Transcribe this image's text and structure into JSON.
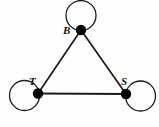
{
  "figure": {
    "type": "graph-diagram",
    "title": "",
    "background_color": "#fefefe",
    "stroke_color": "#1a1a1a",
    "node_fill_color": "#000000",
    "width": 159,
    "height": 127
  },
  "graph_data": {
    "type": "graph",
    "description": "Undirected graph on three vertices B, T, S forming a triangle, with a self-loop at each vertex",
    "vertices": [
      {
        "id": "B",
        "label": "B",
        "cx": 81,
        "cy": 30,
        "r": 5.2,
        "label_x": 63,
        "label_y": 25,
        "loop": {
          "cx": 81,
          "cy": 15.5,
          "r": 15,
          "position": "above"
        }
      },
      {
        "id": "T",
        "label": "T",
        "cx": 38,
        "cy": 93.5,
        "r": 5.2,
        "label_x": 29,
        "label_y": 76,
        "loop": {
          "cx": 24.5,
          "cy": 95.5,
          "r": 15,
          "position": "left"
        }
      },
      {
        "id": "S",
        "label": "S",
        "cx": 126,
        "cy": 94,
        "r": 5.2,
        "label_x": 121,
        "label_y": 76,
        "loop": {
          "cx": 140.5,
          "cy": 96,
          "r": 15,
          "position": "right"
        }
      }
    ],
    "edges": [
      {
        "from": "B",
        "to": "T",
        "x1": 81,
        "y1": 30,
        "x2": 38,
        "y2": 93.5
      },
      {
        "from": "B",
        "to": "S",
        "x1": 81,
        "y1": 30,
        "x2": 126,
        "y2": 94
      },
      {
        "from": "T",
        "to": "S",
        "x1": 38,
        "y1": 93.5,
        "x2": 126,
        "y2": 94
      }
    ],
    "self_loops": [
      "B",
      "T",
      "S"
    ],
    "edge_count": 3,
    "vertex_count": 3
  },
  "labels": {
    "b": "B",
    "t": "T",
    "s": "S"
  },
  "icons": {
    "vertex": "filled-circle-node-icon",
    "loop": "self-loop-icon",
    "edge": "graph-edge-icon"
  }
}
